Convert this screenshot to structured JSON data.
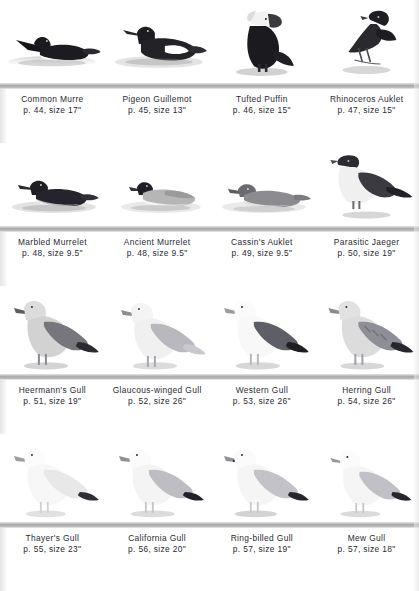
{
  "page": {
    "type": "field-guide-plate",
    "background": "#ffffff",
    "separator_color": "#a8a8a8",
    "text_color": "#2a2a33",
    "columns": 4,
    "rows": 4
  },
  "rows": [
    {
      "row_index": 1,
      "pose": "swimming-swimming-standing-standing",
      "entries": [
        {
          "name": "Common Murre",
          "page_size": "p. 44, size 17\"",
          "page": "44",
          "size": "17\"",
          "pose": "swimming",
          "facing": "left",
          "tone": "dark"
        },
        {
          "name": "Pigeon Guillemot",
          "page_size": "p. 45, size 13\"",
          "page": "45",
          "size": "13\"",
          "pose": "swimming",
          "facing": "left",
          "tone": "dark-white-patch"
        },
        {
          "name": "Tufted Puffin",
          "page_size": "p. 46, size 15\"",
          "page": "46",
          "size": "15\"",
          "pose": "standing",
          "facing": "right",
          "tone": "dark"
        },
        {
          "name": "Rhinoceros Auklet",
          "page_size": "p. 47, size 15\"",
          "page": "47",
          "size": "15\"",
          "pose": "standing",
          "facing": "right",
          "tone": "dark"
        }
      ]
    },
    {
      "row_index": 2,
      "pose": "swimming-swimming-swimming-standing",
      "entries": [
        {
          "name": "Marbled Murrelet",
          "page_size": "p. 48, size 9.5\"",
          "page": "48",
          "size": "9.5\"",
          "pose": "swimming",
          "facing": "left",
          "tone": "dark"
        },
        {
          "name": "Ancient Murrelet",
          "page_size": "p. 48, size 9.5\"",
          "page": "48",
          "size": "9.5\"",
          "pose": "swimming",
          "facing": "left",
          "tone": "pale-back"
        },
        {
          "name": "Cassin's Auklet",
          "page_size": "p. 49, size 9.5\"",
          "page": "49",
          "size": "9.5\"",
          "pose": "swimming",
          "facing": "left",
          "tone": "mid-gray"
        },
        {
          "name": "Parasitic Jaeger",
          "page_size": "p. 50, size 19\"",
          "page": "50",
          "size": "19\"",
          "pose": "standing",
          "facing": "left",
          "tone": "dark-back-white-belly"
        }
      ]
    },
    {
      "row_index": 3,
      "pose": "standing",
      "entries": [
        {
          "name": "Heermann's Gull",
          "page_size": "p. 51, size 19\"",
          "page": "51",
          "size": "19\"",
          "pose": "standing",
          "facing": "left",
          "tone": "gray"
        },
        {
          "name": "Glaucous-winged Gull",
          "page_size": "p. 52, size 26\"",
          "page": "52",
          "size": "26\"",
          "pose": "standing",
          "facing": "left",
          "tone": "pale-gray"
        },
        {
          "name": "Western Gull",
          "page_size": "p. 53, size 26\"",
          "page": "53",
          "size": "26\"",
          "pose": "standing",
          "facing": "left",
          "tone": "dark-mantle"
        },
        {
          "name": "Herring Gull",
          "page_size": "p. 54, size 26\"",
          "page": "54",
          "size": "26\"",
          "pose": "standing",
          "facing": "left",
          "tone": "mottled"
        }
      ]
    },
    {
      "row_index": 4,
      "pose": "standing",
      "entries": [
        {
          "name": "Thayer's Gull",
          "page_size": "p. 55, size 23\"",
          "page": "55",
          "size": "23\"",
          "pose": "standing",
          "facing": "left",
          "tone": "very-pale"
        },
        {
          "name": "California Gull",
          "page_size": "p. 56, size 20\"",
          "page": "56",
          "size": "20\"",
          "pose": "standing",
          "facing": "left",
          "tone": "pale-gray"
        },
        {
          "name": "Ring-billed Gull",
          "page_size": "p. 57, size 19\"",
          "page": "57",
          "size": "19\"",
          "pose": "standing",
          "facing": "left",
          "tone": "pale-gray"
        },
        {
          "name": "Mew Gull",
          "page_size": "p. 57, size 18\"",
          "page": "57",
          "size": "18\"",
          "pose": "standing",
          "facing": "left",
          "tone": "pale-gray"
        }
      ]
    }
  ]
}
